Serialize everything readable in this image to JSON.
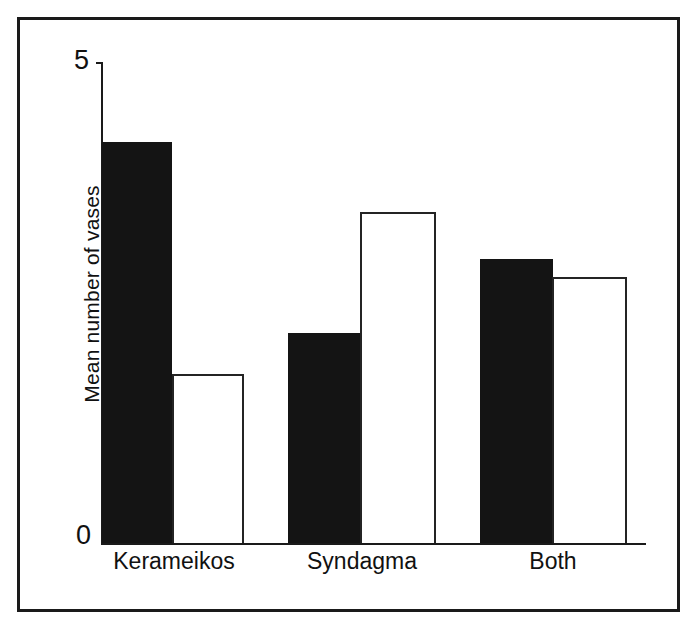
{
  "figure": {
    "frame_color": "#1a1a1a",
    "background": "#ffffff"
  },
  "axes": {
    "y_title": "Mean number of vases",
    "y_tick_top": "5",
    "y_tick_bottom": "0"
  },
  "chart_data": {
    "type": "bar",
    "title": "",
    "xlabel": "",
    "ylabel": "Mean number of vases",
    "ylim": [
      0,
      5
    ],
    "yticks": [
      0,
      5
    ],
    "grid": false,
    "legend": "none",
    "categories": [
      "Kerameikos",
      "Syndagma",
      "Both"
    ],
    "series": [
      {
        "name": "filled",
        "style": "solid-black",
        "color": "#141414",
        "values": [
          4.17,
          2.18,
          2.95
        ]
      },
      {
        "name": "open",
        "style": "open-white-outline",
        "color": "#ffffff",
        "edge_color": "#242424",
        "values": [
          1.76,
          3.44,
          2.76
        ]
      }
    ]
  },
  "bars": [
    {
      "id": "kerameikos-filled",
      "category": "Kerameikos",
      "series": "filled",
      "value": 4.17,
      "x": 102,
      "width": 70,
      "fill": "#141414"
    },
    {
      "id": "kerameikos-open",
      "category": "Kerameikos",
      "series": "open",
      "value": 1.76,
      "x": 172,
      "width": 72,
      "fill": "#ffffff"
    },
    {
      "id": "syndagma-filled",
      "category": "Syndagma",
      "series": "filled",
      "value": 2.18,
      "x": 288,
      "width": 73,
      "fill": "#141414"
    },
    {
      "id": "syndagma-open",
      "category": "Syndagma",
      "series": "open",
      "value": 3.44,
      "x": 360,
      "width": 76,
      "fill": "#ffffff"
    },
    {
      "id": "both-filled",
      "category": "Both",
      "series": "filled",
      "value": 2.95,
      "x": 480,
      "width": 73,
      "fill": "#141414"
    },
    {
      "id": "both-open",
      "category": "Both",
      "series": "open",
      "value": 2.76,
      "x": 552,
      "width": 75,
      "fill": "#ffffff"
    }
  ],
  "category_labels": [
    {
      "text": "Kerameikos",
      "center_x": 174
    },
    {
      "text": "Syndagma",
      "center_x": 362
    },
    {
      "text": "Both",
      "center_x": 553
    }
  ]
}
